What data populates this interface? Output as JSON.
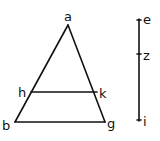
{
  "diagram": {
    "type": "geometric-figure",
    "stroke_color": "#111111",
    "background": "#ffffff",
    "points": {
      "a": {
        "label": "a",
        "x": 68,
        "y": 25,
        "lx": 64,
        "ly": 21
      },
      "b": {
        "label": "b",
        "x": 15,
        "y": 122,
        "lx": 2,
        "ly": 130
      },
      "g": {
        "label": "g",
        "x": 105,
        "y": 122,
        "lx": 107,
        "ly": 128
      },
      "h": {
        "label": "h",
        "x": 31,
        "y": 92,
        "lx": 18,
        "ly": 97
      },
      "k": {
        "label": "k",
        "x": 97,
        "y": 92,
        "lx": 99,
        "ly": 98
      }
    },
    "segments": [
      {
        "name": "ab",
        "from": "a",
        "to": "b"
      },
      {
        "name": "ag",
        "from": "a",
        "to": "g"
      },
      {
        "name": "bg",
        "from": "b",
        "to": "g"
      },
      {
        "name": "hk",
        "from": "h",
        "to": "k"
      }
    ],
    "line_ei": {
      "x": 139,
      "top": 19,
      "bottom": 121,
      "marks": [
        {
          "label": "e",
          "y": 20,
          "lx": 143,
          "ly": 24
        },
        {
          "label": "z",
          "y": 54,
          "lx": 143,
          "ly": 60
        },
        {
          "label": "i",
          "y": 120,
          "lx": 143,
          "ly": 126
        }
      ]
    }
  }
}
